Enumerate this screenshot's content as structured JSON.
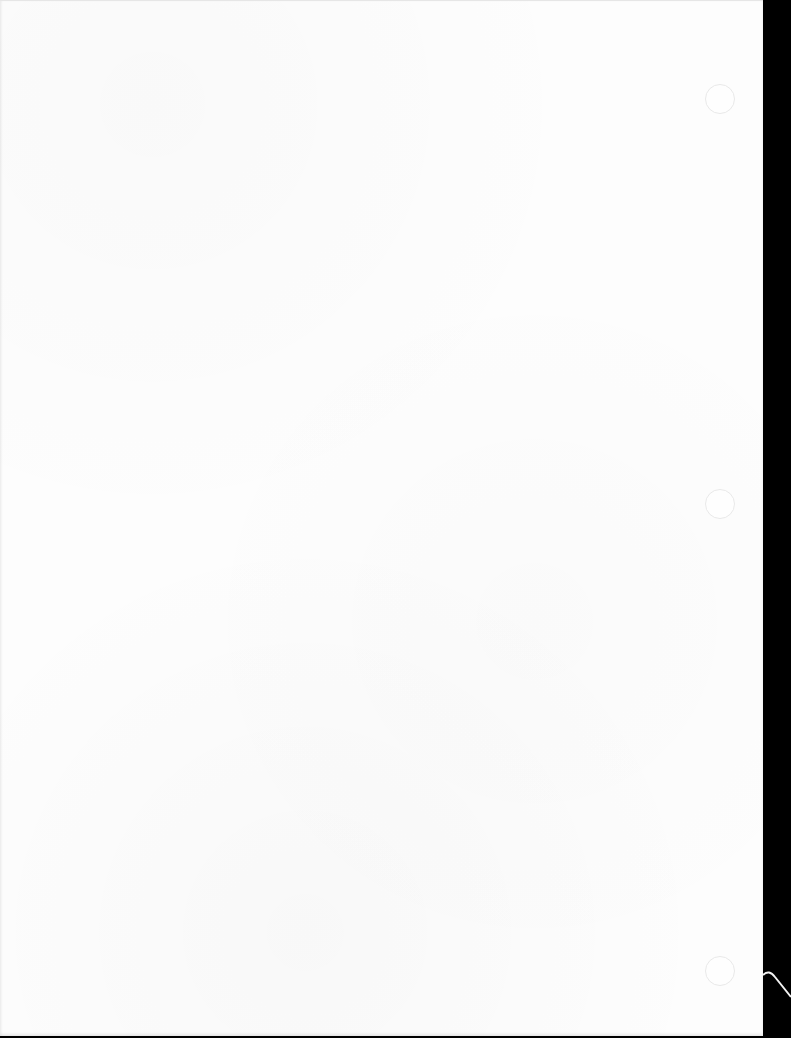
{
  "document": {
    "type": "scanned-page",
    "text_content": "",
    "paper_color": "#fdfdfd",
    "scanner_background_color": "#000000",
    "punch_holes": [
      {
        "position": "top"
      },
      {
        "position": "middle"
      },
      {
        "position": "bottom"
      }
    ]
  }
}
